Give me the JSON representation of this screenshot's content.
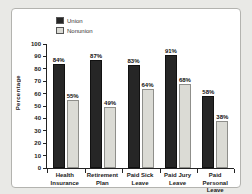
{
  "surface": {
    "background": "#e9e9e6"
  },
  "panel": {
    "background": "#ffffff",
    "border_color": "#b3b3af"
  },
  "chart_data": {
    "type": "bar",
    "title": "",
    "categories": [
      "Health\nInsurance",
      "Retirement\nPlan",
      "Paid Sick\nLeave",
      "Paid Jury\nLeave",
      "Paid Personal\nLeave"
    ],
    "series": [
      {
        "name": "Union",
        "color": "#262626",
        "values": [
          84,
          87,
          83,
          91,
          58
        ],
        "labels": [
          "84%",
          "87%",
          "83%",
          "91%",
          "58%"
        ]
      },
      {
        "name": "Nonunion",
        "color": "#dbdbd5",
        "values": [
          55,
          49,
          64,
          68,
          38
        ],
        "labels": [
          "55%",
          "49%",
          "64%",
          "68%",
          "38%"
        ]
      }
    ],
    "xlabel": "",
    "ylabel": "Percentage",
    "ylim": [
      0,
      100
    ],
    "yticks": [
      0,
      10,
      20,
      30,
      40,
      50,
      60,
      70,
      80,
      90,
      100
    ],
    "legend_position": "top-left",
    "grid": false
  }
}
